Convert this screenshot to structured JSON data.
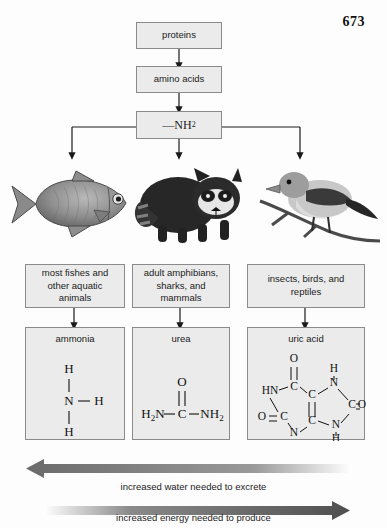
{
  "page": {
    "number": "673"
  },
  "flow": {
    "proteins": "proteins",
    "amino_acids": "amino acids",
    "amine_group": "—NH",
    "amine_sub": "2"
  },
  "groups": [
    {
      "label": "most fishes and other aquatic animals",
      "animal": "fish-illustration"
    },
    {
      "label": "adult amphibians, sharks, and mammals",
      "animal": "raccoon-illustration"
    },
    {
      "label": "insects, birds, and reptiles",
      "animal": "bird-illustration"
    }
  ],
  "wastes": [
    {
      "name": "ammonia",
      "atoms": [
        "H",
        "N",
        "H",
        "H"
      ]
    },
    {
      "name": "urea",
      "atoms": [
        "O",
        "H",
        "2",
        "N",
        "C",
        "NH",
        "2"
      ]
    },
    {
      "name": "uric acid",
      "atoms": [
        "O",
        "C",
        "H",
        "N",
        "HN",
        "C",
        "C",
        "C",
        "O",
        "O",
        "C",
        "C",
        "N",
        "N",
        "H",
        "H"
      ]
    }
  ],
  "scales": [
    {
      "label": "increased water needed to excrete",
      "direction": "left",
      "color": "#6e6e6e"
    },
    {
      "label": "increased energy needed to produce",
      "direction": "right",
      "color": "#5a5a5a"
    }
  ]
}
